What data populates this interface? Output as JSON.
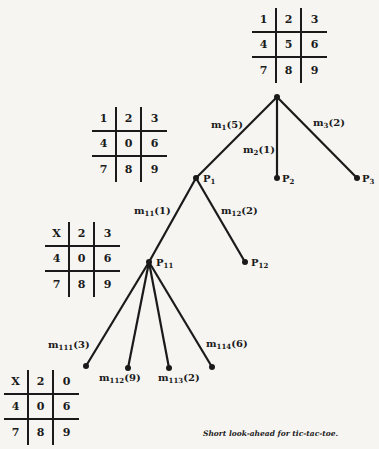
{
  "title": "Short look-ahead for tic-tac-toe.",
  "boards": [
    {
      "id": "root-board",
      "cells": [
        "1",
        "2",
        "3",
        "4",
        "5",
        "6",
        "7",
        "8",
        "9"
      ]
    },
    {
      "id": "p1-board",
      "cells": [
        "1",
        "2",
        "3",
        "4",
        "0",
        "6",
        "7",
        "8",
        "9"
      ]
    },
    {
      "id": "p11-board",
      "cells": [
        "X",
        "2",
        "3",
        "4",
        "0",
        "6",
        "7",
        "8",
        "9"
      ]
    },
    {
      "id": "p111-board",
      "cells": [
        "X",
        "2",
        "0",
        "4",
        "0",
        "6",
        "7",
        "8",
        "9"
      ]
    }
  ],
  "nodes": {
    "root": {
      "label": ""
    },
    "p1": {
      "label": "P",
      "sub": "1"
    },
    "p2": {
      "label": "P",
      "sub": "2"
    },
    "p3": {
      "label": "P",
      "sub": "3"
    },
    "p11": {
      "label": "P",
      "sub": "11"
    },
    "p12": {
      "label": "P",
      "sub": "12"
    }
  },
  "edges": {
    "m1": {
      "label": "m",
      "sub": "1",
      "value": "(5)"
    },
    "m2": {
      "label": "m",
      "sub": "2",
      "value": "(1)"
    },
    "m3": {
      "label": "m",
      "sub": "3",
      "value": "(2)"
    },
    "m11": {
      "label": "m",
      "sub": "11",
      "value": "(1)"
    },
    "m12": {
      "label": "m",
      "sub": "12",
      "value": "(2)"
    },
    "m111": {
      "label": "m",
      "sub": "111",
      "value": "(3)"
    },
    "m112": {
      "label": "m",
      "sub": "112",
      "value": "(9)"
    },
    "m113": {
      "label": "m",
      "sub": "113",
      "value": "(2)"
    },
    "m114": {
      "label": "m",
      "sub": "114",
      "value": "(6)"
    }
  }
}
